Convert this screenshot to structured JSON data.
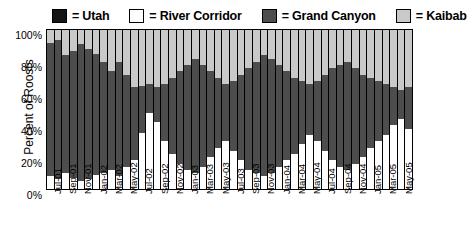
{
  "legend": {
    "items": [
      {
        "label": "= Utah",
        "key": "utah",
        "color": "#151515"
      },
      {
        "label": "= River Corridor",
        "key": "river",
        "color": "#ffffff"
      },
      {
        "label": "= Grand Canyon",
        "key": "gc",
        "color": "#4d4d4d"
      },
      {
        "label": "= Kaibab",
        "key": "kaibab",
        "color": "#c9c9c9"
      }
    ]
  },
  "axes": {
    "ylabel": "Percent of Roosts",
    "yticks": [
      "100%",
      "80%",
      "60%",
      "40%",
      "20%",
      "0%"
    ]
  },
  "chart_data": {
    "type": "bar",
    "stacked": true,
    "normalized": true,
    "title": "",
    "xlabel": "",
    "ylabel": "Percent of Roosts",
    "ylim": [
      0,
      100
    ],
    "ytick_values": [
      0,
      20,
      40,
      60,
      80,
      100
    ],
    "ytick_labels": [
      "0%",
      "20%",
      "40%",
      "60%",
      "80%",
      "100%"
    ],
    "grid": false,
    "legend_position": "top",
    "colors": {
      "Utah": "#151515",
      "River Corridor": "#ffffff",
      "Grand Canyon": "#4d4d4d",
      "Kaibab": "#c9c9c9"
    },
    "categories": [
      "Jul-01",
      "Aug-01",
      "Sep-01",
      "Oct-01",
      "Nov-01",
      "Dec-01",
      "Jan-02",
      "Feb-02",
      "Mar-02",
      "Apr-02",
      "May-02",
      "Jun-02",
      "Jul-02",
      "Aug-02",
      "Sep-02",
      "Oct-02",
      "Nov-02",
      "Dec-02",
      "Jan-03",
      "Feb-03",
      "Mar-03",
      "Apr-03",
      "May-03",
      "Jun-03",
      "Jul-03",
      "Aug-03",
      "Sep-03",
      "Oct-03",
      "Nov-03",
      "Dec-03",
      "Jan-04",
      "Feb-04",
      "Mar-04",
      "Apr-04",
      "May-04",
      "Jun-04",
      "Jul-04",
      "Aug-04",
      "Sep-04",
      "Oct-04",
      "Nov-04",
      "Dec-04",
      "Jan-05",
      "Feb-05",
      "Mar-05",
      "Apr-05",
      "May-05",
      "Jun-05"
    ],
    "xtick_labels": [
      "Jul-01",
      "Sep-01",
      "Nov-01",
      "Jan-02",
      "Mar-02",
      "May-02",
      "Jul-02",
      "Sep-02",
      "Nov-02",
      "Jan-03",
      "Mar-03",
      "May-03",
      "Jul-03",
      "Sep-03",
      "Nov-03",
      "Jan-04",
      "Mar-04",
      "May-04",
      "Jul-04",
      "Sep-04",
      "Nov-04",
      "Jan-05",
      "Mar-05",
      "May-05"
    ],
    "xtick_every": 2,
    "series": [
      {
        "name": "Utah",
        "values": [
          0,
          0,
          0,
          0,
          0,
          0,
          0,
          0,
          0,
          0,
          0,
          0,
          0,
          0,
          0,
          0,
          0,
          0,
          0,
          0,
          0,
          0,
          0,
          0,
          0,
          0,
          0,
          0,
          0,
          0,
          0,
          0,
          0,
          0,
          0,
          0,
          0,
          0,
          0,
          0,
          0,
          0,
          0,
          0,
          0,
          0,
          0,
          0
        ]
      },
      {
        "name": "River Corridor",
        "values": [
          8,
          6,
          10,
          7,
          5,
          6,
          9,
          10,
          12,
          8,
          14,
          18,
          35,
          48,
          42,
          30,
          22,
          16,
          12,
          10,
          14,
          20,
          26,
          30,
          24,
          18,
          12,
          10,
          8,
          10,
          14,
          18,
          22,
          28,
          34,
          30,
          24,
          18,
          14,
          12,
          16,
          20,
          26,
          30,
          34,
          40,
          44,
          38
        ]
      },
      {
        "name": "Grand Canyon",
        "values": [
          84,
          88,
          74,
          80,
          86,
          82,
          76,
          70,
          62,
          72,
          58,
          46,
          30,
          18,
          22,
          36,
          48,
          58,
          66,
          72,
          64,
          54,
          44,
          36,
          44,
          54,
          64,
          70,
          76,
          72,
          64,
          56,
          48,
          40,
          32,
          38,
          48,
          58,
          64,
          68,
          60,
          52,
          44,
          38,
          32,
          24,
          18,
          26
        ]
      },
      {
        "name": "Kaibab",
        "values": [
          8,
          6,
          16,
          13,
          9,
          12,
          15,
          20,
          26,
          20,
          28,
          36,
          35,
          34,
          36,
          34,
          30,
          26,
          22,
          18,
          22,
          26,
          30,
          34,
          32,
          28,
          24,
          20,
          16,
          18,
          22,
          26,
          30,
          32,
          34,
          32,
          28,
          24,
          22,
          20,
          24,
          28,
          30,
          32,
          34,
          36,
          38,
          36
        ]
      }
    ]
  }
}
